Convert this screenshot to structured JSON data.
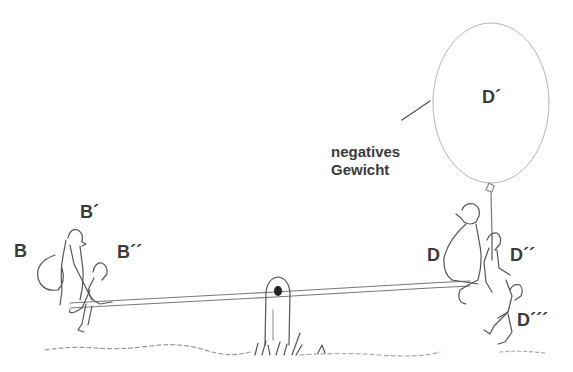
{
  "figure": {
    "ink_color": "#3a3a3a",
    "background": "#ffffff"
  },
  "labels": {
    "B": "B",
    "B1": "B´",
    "B2": "B´´",
    "D": "D",
    "D1": "D´",
    "D2": "D´´",
    "D3": "D´´´"
  },
  "balloon": {
    "label": "D´",
    "caption_line1": "negatives",
    "caption_line2": "Gewicht"
  }
}
